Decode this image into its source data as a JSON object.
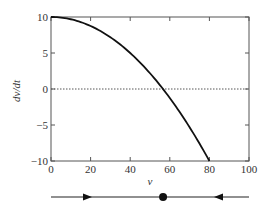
{
  "chart_data": {
    "type": "line",
    "title": "",
    "xlabel": "v",
    "ylabel": "dv/dt",
    "xlim": [
      0,
      100
    ],
    "ylim": [
      -10,
      10
    ],
    "xticks": [
      0,
      20,
      40,
      60,
      80,
      100
    ],
    "yticks": [
      -10,
      -5,
      0,
      5,
      10
    ],
    "xtick_labels": [
      "0",
      "20",
      "40",
      "60",
      "80",
      "100"
    ],
    "ytick_labels": [
      "−10",
      "−5",
      "0",
      "5",
      "10"
    ],
    "grid": false,
    "legend": null,
    "series": [
      {
        "name": "dv/dt = 10 − v²/320",
        "x": [
          0,
          10,
          20,
          30,
          40,
          50,
          56.6,
          60,
          70,
          80
        ],
        "y": [
          10,
          9.69,
          8.75,
          7.19,
          5.0,
          2.19,
          0,
          -1.25,
          -5.31,
          -10
        ]
      }
    ],
    "reference_lines": [
      {
        "type": "horizontal",
        "y": 0,
        "style": "dotted"
      }
    ],
    "phase_line": {
      "equilibrium": 56.6,
      "equilibrium_type": "stable",
      "arrows": [
        {
          "position": "left",
          "direction": "right"
        },
        {
          "position": "right",
          "direction": "left"
        }
      ]
    }
  },
  "colors": {
    "curve": "#111111",
    "axes": "#555555",
    "zero_line": "#555555"
  }
}
